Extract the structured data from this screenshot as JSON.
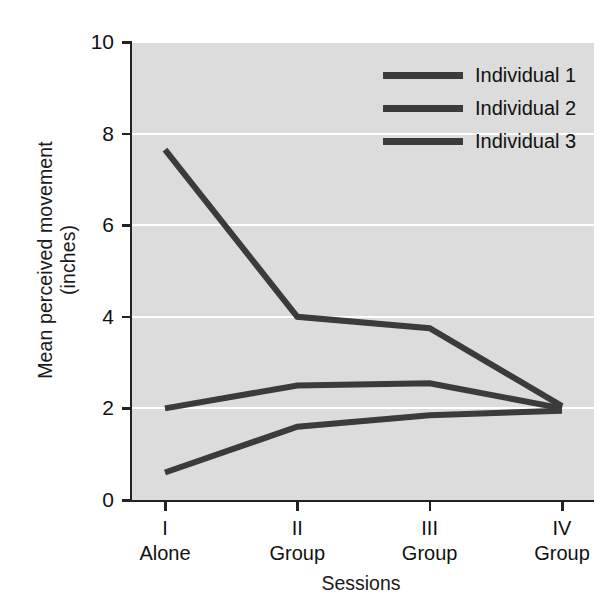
{
  "chart_data": {
    "type": "line",
    "title": "",
    "xlabel": "Sessions",
    "ylabel_line1": "Mean perceived movement",
    "ylabel_line2": "(inches)",
    "categories": [
      "I",
      "II",
      "III",
      "IV"
    ],
    "category_conditions": [
      "Alone",
      "Group",
      "Group",
      "Group"
    ],
    "xtick_labels": [
      {
        "roman": "I",
        "condition": "Alone"
      },
      {
        "roman": "II",
        "condition": "Group"
      },
      {
        "roman": "III",
        "condition": "Group"
      },
      {
        "roman": "IV",
        "condition": "Group"
      }
    ],
    "ylim": [
      0,
      10
    ],
    "ytick_values": [
      0,
      2,
      4,
      6,
      8,
      10
    ],
    "ytick_labels": [
      "0",
      "2",
      "4",
      "6",
      "8",
      "10"
    ],
    "grid": true,
    "grid_color": "#ffffff",
    "plot_background": "#dcdcdc",
    "line_color": "#3b3b3b",
    "legend_position": "top-right",
    "series": [
      {
        "name": "Individual 1",
        "values": [
          7.65,
          4.0,
          3.75,
          2.05
        ]
      },
      {
        "name": "Individual 2",
        "values": [
          2.0,
          2.5,
          2.55,
          2.0
        ]
      },
      {
        "name": "Individual 3",
        "values": [
          0.6,
          1.6,
          1.85,
          1.95
        ]
      }
    ]
  },
  "legend": {
    "entries": [
      {
        "label": "Individual 1"
      },
      {
        "label": "Individual 2"
      },
      {
        "label": "Individual 3"
      }
    ]
  }
}
